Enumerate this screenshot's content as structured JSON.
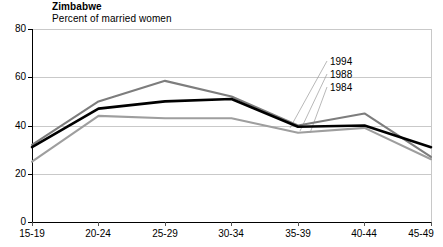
{
  "header": {
    "title": "Zimbabwe",
    "subtitle": "Percent of married women"
  },
  "chart_data": {
    "type": "line",
    "title": "Zimbabwe",
    "subtitle": "Percent of married women",
    "xlabel": "",
    "ylabel": "",
    "categories": [
      "15-19",
      "20-24",
      "25-29",
      "30-34",
      "35-39",
      "40-44",
      "45-49"
    ],
    "ylim": [
      0,
      80
    ],
    "yticks": [
      0,
      20,
      40,
      60,
      80
    ],
    "grid": true,
    "legend_position": "inside-right",
    "series": [
      {
        "name": "1994",
        "color": "#7d7d7d",
        "values": [
          32,
          50,
          58.5,
          52,
          40,
          45,
          27
        ]
      },
      {
        "name": "1988",
        "color": "#000000",
        "values": [
          31,
          47,
          50,
          51,
          39.5,
          40,
          31
        ]
      },
      {
        "name": "1984",
        "color": "#9e9e9e",
        "values": [
          25,
          44,
          43,
          43,
          37,
          39,
          26
        ]
      }
    ]
  },
  "axes": {
    "ytick_labels": [
      "80",
      "60",
      "40",
      "20",
      "0"
    ],
    "xtick_labels": [
      "15-19",
      "20-24",
      "25-29",
      "30-34",
      "35-39",
      "40-44",
      "45-49"
    ]
  },
  "legend": {
    "items": [
      {
        "label": "1994"
      },
      {
        "label": "1988"
      },
      {
        "label": "1984"
      }
    ]
  }
}
